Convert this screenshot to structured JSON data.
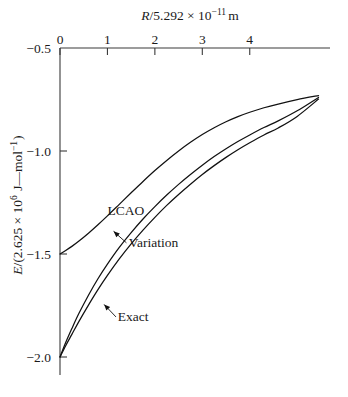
{
  "chart_data": {
    "type": "line",
    "title": "",
    "xlabel": "R/5.292 × 10⁻¹¹ m",
    "ylabel": "E/(2.625 × 10⁶ J—mol⁻¹)",
    "xlabel_parts": {
      "var": "R",
      "slash": "/5.292 × 10",
      "exp": "−11",
      "unit": "m"
    },
    "ylabel_parts": {
      "var": "E",
      "mid": "/(2.625 × 10",
      "exp1": "6",
      "mid2": " J—mol",
      "exp2": "−1",
      "close": ")"
    },
    "xlim": [
      0,
      5.6
    ],
    "ylim": [
      -2.05,
      -0.5
    ],
    "xticks": [
      0,
      1,
      2,
      3,
      4
    ],
    "xtick_labels": [
      "0",
      "1",
      "2",
      "3",
      "4"
    ],
    "yticks": [
      -0.5,
      -1.0,
      -1.5,
      -2.0
    ],
    "ytick_labels": [
      "−0.5",
      "−1.0",
      "−1.5",
      "−2.0"
    ],
    "grid": false,
    "legend_position": "inline-annotations",
    "axis_style": "top-x-axis, left-y-axis, ticks inward",
    "series": [
      {
        "name": "LCAO",
        "label": "LCAO",
        "label_x": 1.0,
        "label_y": -1.31,
        "color": "#111111",
        "x": [
          0.0,
          0.12,
          0.25,
          0.4,
          0.6,
          0.8,
          1.0,
          1.25,
          1.5,
          1.75,
          2.0,
          2.25,
          2.5,
          2.75,
          3.0,
          3.25,
          3.5,
          3.75,
          4.0,
          4.3,
          4.6,
          5.0,
          5.45
        ],
        "y": [
          -1.5,
          -1.483,
          -1.463,
          -1.437,
          -1.399,
          -1.358,
          -1.315,
          -1.259,
          -1.203,
          -1.148,
          -1.095,
          -1.046,
          -1.0,
          -0.958,
          -0.92,
          -0.887,
          -0.858,
          -0.833,
          -0.812,
          -0.79,
          -0.772,
          -0.751,
          -0.731
        ]
      },
      {
        "name": "Variation",
        "label": "Variation",
        "label_x": 1.45,
        "label_y": -1.465,
        "leader_from_x": 1.4,
        "leader_from_y": -1.465,
        "leader_to_x": 1.13,
        "leader_to_y": -1.39,
        "color": "#111111",
        "x": [
          0.0,
          0.12,
          0.25,
          0.4,
          0.6,
          0.8,
          1.0,
          1.25,
          1.5,
          1.75,
          2.0,
          2.25,
          2.5,
          2.75,
          3.0,
          3.25,
          3.5,
          3.75,
          4.0,
          4.3,
          4.6,
          5.0,
          5.45
        ],
        "y": [
          -2.0,
          -1.93,
          -1.862,
          -1.788,
          -1.7,
          -1.62,
          -1.549,
          -1.468,
          -1.396,
          -1.33,
          -1.27,
          -1.214,
          -1.162,
          -1.114,
          -1.069,
          -1.027,
          -0.989,
          -0.954,
          -0.922,
          -0.886,
          -0.854,
          -0.805,
          -0.74
        ]
      },
      {
        "name": "Exact",
        "label": "Exact",
        "label_x": 1.22,
        "label_y": -1.825,
        "leader_from_x": 1.18,
        "leader_from_y": -1.825,
        "leader_to_x": 0.93,
        "leader_to_y": -1.745,
        "color": "#111111",
        "x": [
          0.0,
          0.12,
          0.25,
          0.4,
          0.6,
          0.8,
          1.0,
          1.25,
          1.5,
          1.75,
          2.0,
          2.25,
          2.5,
          2.75,
          3.0,
          3.25,
          3.5,
          3.75,
          4.0,
          4.3,
          4.6,
          5.0,
          5.45
        ],
        "y": [
          -2.0,
          -1.945,
          -1.89,
          -1.827,
          -1.748,
          -1.673,
          -1.604,
          -1.524,
          -1.451,
          -1.384,
          -1.322,
          -1.264,
          -1.211,
          -1.161,
          -1.114,
          -1.071,
          -1.031,
          -0.994,
          -0.96,
          -0.922,
          -0.888,
          -0.832,
          -0.748
        ]
      }
    ],
    "annotations": [
      {
        "text": "LCAO",
        "x": 1.0,
        "y": -1.31
      },
      {
        "text": "Variation",
        "x": 1.45,
        "y": -1.465
      },
      {
        "text": "Exact",
        "x": 1.22,
        "y": -1.825
      }
    ]
  }
}
